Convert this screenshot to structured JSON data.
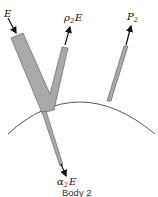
{
  "diagram": {
    "labels": {
      "incident": {
        "main": "E",
        "sub": ""
      },
      "reflected": {
        "pre": "ρ",
        "sub": "2",
        "post": "E"
      },
      "transmitted": {
        "pre": "α",
        "sub": "2",
        "post": "E"
      },
      "emitted": {
        "pre": "P",
        "sub": "2"
      }
    },
    "caption": "Body 2",
    "colors": {
      "beam_fill": "#a9a9a9",
      "beam_stroke": "#555555",
      "arrow": "#111111",
      "surface": "#444444"
    }
  }
}
